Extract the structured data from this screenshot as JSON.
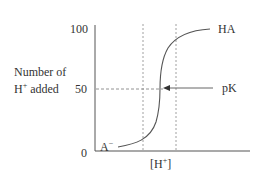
{
  "diagram": {
    "type": "titration-curve",
    "y_axis": {
      "label_line1": "Number of",
      "label_line2": "H",
      "label_line2_sup": "+",
      "label_line2_rest": " added",
      "ticks": [
        "100",
        "50",
        "0"
      ]
    },
    "x_axis": {
      "label": "[H",
      "label_sup": "+",
      "label_close": "]"
    },
    "curve_labels": {
      "top": "HA",
      "bottom": "A",
      "bottom_sup": "−",
      "midpoint": "pK"
    },
    "colors": {
      "line": "#555555",
      "text": "#333333",
      "dashed": "#777777"
    }
  }
}
